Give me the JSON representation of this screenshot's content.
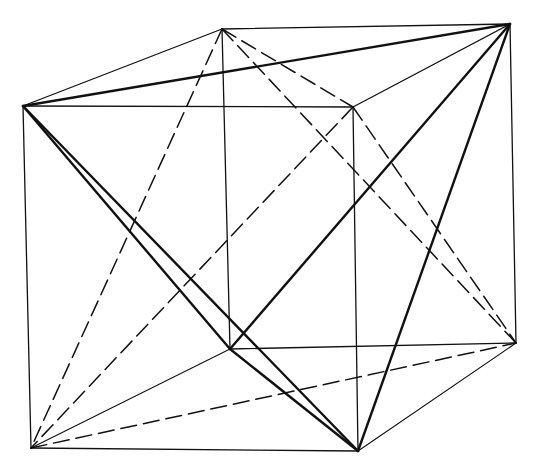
{
  "diagram": {
    "vertices": {
      "A": [
        23,
        106
      ],
      "B": [
        353,
        107
      ],
      "C": [
        358,
        451
      ],
      "D": [
        31,
        448
      ],
      "E": [
        222,
        29
      ],
      "F": [
        510,
        24
      ],
      "G": [
        516,
        343
      ],
      "H": [
        230,
        349
      ]
    },
    "edges": [
      {
        "from": "A",
        "to": "B",
        "style": "cube"
      },
      {
        "from": "B",
        "to": "C",
        "style": "cube"
      },
      {
        "from": "C",
        "to": "D",
        "style": "cube"
      },
      {
        "from": "D",
        "to": "A",
        "style": "cube"
      },
      {
        "from": "E",
        "to": "F",
        "style": "cube"
      },
      {
        "from": "F",
        "to": "G",
        "style": "cube"
      },
      {
        "from": "A",
        "to": "E",
        "style": "cube"
      },
      {
        "from": "B",
        "to": "F",
        "style": "cube"
      },
      {
        "from": "C",
        "to": "G",
        "style": "thin"
      },
      {
        "from": "E",
        "to": "H",
        "style": "cube"
      },
      {
        "from": "H",
        "to": "G",
        "style": "cube"
      },
      {
        "from": "D",
        "to": "H",
        "style": "thin"
      },
      {
        "from": "A",
        "to": "F",
        "style": "bold"
      },
      {
        "from": "A",
        "to": "C",
        "style": "bold"
      },
      {
        "from": "A",
        "to": "H",
        "style": "bold"
      },
      {
        "from": "H",
        "to": "F",
        "style": "bold"
      },
      {
        "from": "F",
        "to": "C",
        "style": "bold"
      },
      {
        "from": "H",
        "to": "C",
        "style": "bold"
      },
      {
        "from": "E",
        "to": "B",
        "style": "dash"
      },
      {
        "from": "E",
        "to": "D",
        "style": "dash"
      },
      {
        "from": "E",
        "to": "G",
        "style": "dash"
      },
      {
        "from": "B",
        "to": "D",
        "style": "dash"
      },
      {
        "from": "B",
        "to": "G",
        "style": "dash"
      },
      {
        "from": "D",
        "to": "G",
        "style": "dash"
      }
    ]
  }
}
